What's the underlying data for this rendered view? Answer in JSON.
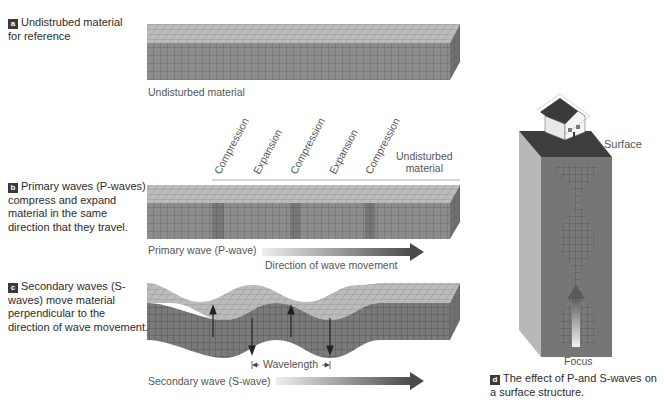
{
  "panels": {
    "a": {
      "badge": "a",
      "caption": "Undistrubed material for reference",
      "block_label": "Undisturbed material"
    },
    "b": {
      "badge": "b",
      "caption": "Primary waves (P-waves) compress and expand material in the same direction that they travel.",
      "zone_labels": [
        "Compression",
        "Expansion",
        "Compression",
        "Expansion",
        "Compression"
      ],
      "undisturbed_label_line1": "Undisturbed",
      "undisturbed_label_line2": "material",
      "wave_label": "Primary wave (P-wave)",
      "direction_label": "Direction of wave movement"
    },
    "c": {
      "badge": "c",
      "caption": "Secondary waves (S-waves) move material perpendicular to the direction of wave movement.",
      "wavelength_label": "Wavelength",
      "wave_label": "Secondary wave (S-wave)"
    },
    "d": {
      "badge": "d",
      "caption": "The effect of P-and S-waves on a surface structure.",
      "surface_label": "Surface",
      "focus_label": "Focus"
    }
  },
  "colors": {
    "block_top": "#b5b5b5",
    "block_front": "#8a8a8a",
    "block_side": "#6e6e6e",
    "grid_line": "#4a4a4a",
    "arrow_dark": "#555555",
    "badge_bg": "#3a3a3a"
  }
}
